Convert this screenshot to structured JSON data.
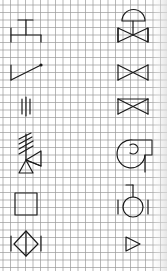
{
  "sheet": {
    "width": 167,
    "height": 271,
    "background": "#ffffff",
    "grid_color": "#9a9a9a",
    "line_color": "#1a1a1a",
    "grid_spacing_px": 7.5,
    "grid_origin": [
      3,
      5
    ]
  },
  "symbols": {
    "left_column": [
      {
        "id": "t-junction",
        "label": "T-shaped line symbol"
      },
      {
        "id": "diagonal-line",
        "label": "diagonal line with dot end"
      },
      {
        "id": "triple-bars",
        "label": "three vertical bars"
      },
      {
        "id": "hatched-valve",
        "label": "hatched stem with triangles"
      },
      {
        "id": "square",
        "label": "square"
      },
      {
        "id": "diamond",
        "label": "diamond between bars"
      }
    ],
    "right_column": [
      {
        "id": "dome-valve",
        "label": "gate valve with dome actuator"
      },
      {
        "id": "gate-valve",
        "label": "gate valve"
      },
      {
        "id": "gate-valve-boxed",
        "label": "gate valve with top bar"
      },
      {
        "id": "centrifugal-fan",
        "label": "centrifugal fan / pump volute"
      },
      {
        "id": "circle-meter",
        "label": "circle between bars with stem"
      },
      {
        "id": "triangle-arrow",
        "label": "small triangle pointing right"
      }
    ]
  }
}
